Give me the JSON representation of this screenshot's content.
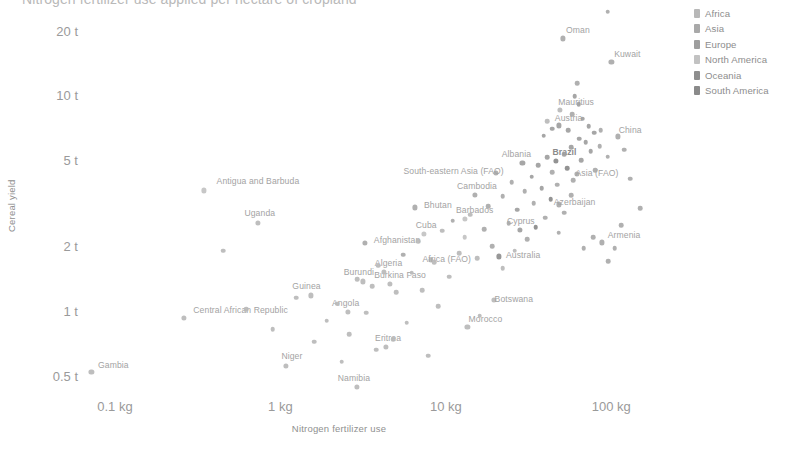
{
  "chart_data": {
    "type": "scatter",
    "title": "Nitrogen fertilizer use applied per hectare of cropland",
    "xlabel": "Nitrogen fertilizer use",
    "ylabel": "Cereal yield",
    "xscale": "log",
    "yscale": "log",
    "xlim": [
      0.055,
      260
    ],
    "ylim": [
      0.42,
      26
    ],
    "grid": false,
    "legend_position": "right",
    "xticks": [
      {
        "value": 0.1,
        "label": "0.1 kg"
      },
      {
        "value": 1,
        "label": "1 kg"
      },
      {
        "value": 10,
        "label": "10 kg"
      },
      {
        "value": 100,
        "label": "100 kg"
      }
    ],
    "yticks": [
      {
        "value": 20,
        "label": "20 t"
      },
      {
        "value": 10,
        "label": "10 t"
      },
      {
        "value": 5,
        "label": "5 t"
      },
      {
        "value": 2,
        "label": "2 t"
      },
      {
        "value": 1,
        "label": "1 t"
      },
      {
        "value": 0.5,
        "label": "0.5 t"
      }
    ],
    "legend": [
      {
        "name": "Africa",
        "color": "#b8b8b8"
      },
      {
        "name": "Asia",
        "color": "#a9a9a9"
      },
      {
        "name": "Europe",
        "color": "#9e9e9e"
      },
      {
        "name": "North America",
        "color": "#c2c2c2"
      },
      {
        "name": "Oceania",
        "color": "#8e8e8e"
      },
      {
        "name": "South America",
        "color": "#8a8a8a"
      }
    ],
    "points": [
      {
        "label": "Gambia",
        "x": 0.072,
        "y": 0.52,
        "continent": "Africa",
        "label_dx": 22,
        "label_dy": -7
      },
      {
        "label": "Central African Republic",
        "x": 0.26,
        "y": 0.93,
        "continent": "Africa",
        "label_dx": 57,
        "label_dy": -8
      },
      {
        "label": "Antigua and Barbuda",
        "x": 0.345,
        "y": 3.62,
        "continent": "North America",
        "label_dx": 54,
        "label_dy": -9
      },
      {
        "label": "Uganda",
        "x": 0.73,
        "y": 2.55,
        "continent": "Africa",
        "label_dx": 2,
        "label_dy": -10
      },
      {
        "label": "Niger",
        "x": 1.08,
        "y": 0.555,
        "continent": "Africa",
        "label_dx": 6,
        "label_dy": -10
      },
      {
        "label": "Guinea",
        "x": 1.52,
        "y": 1.18,
        "continent": "Africa",
        "label_dx": -4,
        "label_dy": -9
      },
      {
        "label": "Angola",
        "x": 2.55,
        "y": 0.99,
        "continent": "Africa",
        "label_dx": -2,
        "label_dy": -9
      },
      {
        "label": "Burundi",
        "x": 3.15,
        "y": 1.37,
        "continent": "Africa",
        "label_dx": -4,
        "label_dy": -9
      },
      {
        "label": "Burkina Faso",
        "x": 4.6,
        "y": 1.33,
        "continent": "Africa",
        "label_dx": 10,
        "label_dy": -9
      },
      {
        "label": "Afghanistan",
        "x": 3.25,
        "y": 2.06,
        "continent": "Asia",
        "label_dx": 32,
        "label_dy": -3
      },
      {
        "label": "Algeria",
        "x": 4.2,
        "y": 1.52,
        "continent": "Africa",
        "label_dx": 5,
        "label_dy": -9
      },
      {
        "label": "Namibia",
        "x": 2.9,
        "y": 0.445,
        "continent": "Africa",
        "label_dx": -3,
        "label_dy": -9
      },
      {
        "label": "Eritrea",
        "x": 4.35,
        "y": 0.68,
        "continent": "Africa",
        "label_dx": 2,
        "label_dy": -9
      },
      {
        "label": "Bhutan",
        "x": 6.5,
        "y": 3.02,
        "continent": "Asia",
        "label_dx": 23,
        "label_dy": -2
      },
      {
        "label": "Cuba",
        "x": 7.4,
        "y": 2.28,
        "continent": "North America",
        "label_dx": 2,
        "label_dy": -9
      },
      {
        "label": "Africa (FAO)",
        "x": 8.1,
        "y": 1.73,
        "continent": "Africa",
        "label_dx": 16,
        "label_dy": -1
      },
      {
        "label": "Morocco",
        "x": 13.5,
        "y": 0.845,
        "continent": "Africa",
        "label_dx": 18,
        "label_dy": -8
      },
      {
        "label": "Botswana",
        "x": 19.5,
        "y": 1.12,
        "continent": "Africa",
        "label_dx": 20,
        "label_dy": -1
      },
      {
        "label": "Barbados",
        "x": 13.0,
        "y": 2.68,
        "continent": "North America",
        "label_dx": 10,
        "label_dy": -9
      },
      {
        "label": "Cambodia",
        "x": 15.0,
        "y": 3.45,
        "continent": "Asia",
        "label_dx": 2,
        "label_dy": -9
      },
      {
        "label": "South-eastern Asia (FAO)",
        "x": 20.0,
        "y": 4.35,
        "continent": "Asia",
        "label_dx": -42,
        "label_dy": -2
      },
      {
        "label": "Albania",
        "x": 29.0,
        "y": 4.85,
        "continent": "Europe",
        "label_dx": -6,
        "label_dy": -9
      },
      {
        "label": "Australia",
        "x": 21.0,
        "y": 1.79,
        "continent": "Oceania",
        "label_dx": 24,
        "label_dy": -1
      },
      {
        "label": "Cyprus",
        "x": 28.0,
        "y": 2.38,
        "continent": "Europe",
        "label_dx": 1,
        "label_dy": -9
      },
      {
        "label": "Brazil",
        "x": 46.0,
        "y": 4.95,
        "continent": "South America",
        "label_dx": 9,
        "label_dy": -9
      },
      {
        "label": "Azerbaijan",
        "x": 48.0,
        "y": 3.12,
        "continent": "Asia",
        "label_dx": 16,
        "label_dy": -2
      },
      {
        "label": "Asia (FAO)",
        "x": 62.0,
        "y": 4.32,
        "continent": "Asia",
        "label_dx": 20,
        "label_dy": -1
      },
      {
        "label": "Mauritius",
        "x": 49.0,
        "y": 8.55,
        "continent": "Africa",
        "label_dx": 16,
        "label_dy": -8
      },
      {
        "label": "Austria",
        "x": 48.0,
        "y": 7.25,
        "continent": "Europe",
        "label_dx": 10,
        "label_dy": -7
      },
      {
        "label": "China",
        "x": 110.0,
        "y": 6.45,
        "continent": "Asia",
        "label_dx": 12,
        "label_dy": -6
      },
      {
        "label": "Armenia",
        "x": 88.0,
        "y": 2.08,
        "continent": "Asia",
        "label_dx": 22,
        "label_dy": -7
      },
      {
        "label": "Oman",
        "x": 51.0,
        "y": 18.4,
        "continent": "Asia",
        "label_dx": 15,
        "label_dy": -8
      },
      {
        "label": "Kuwait",
        "x": 100.0,
        "y": 14.3,
        "continent": "Asia",
        "label_dx": 16,
        "label_dy": -8
      },
      {
        "label": "",
        "x": 95.0,
        "y": 24.5,
        "continent": "Asia"
      },
      {
        "label": "",
        "x": 60.0,
        "y": 9.9,
        "continent": "Europe"
      },
      {
        "label": "",
        "x": 63.5,
        "y": 9.1,
        "continent": "Europe"
      },
      {
        "label": "",
        "x": 58.0,
        "y": 8.2,
        "continent": "Asia"
      },
      {
        "label": "",
        "x": 67.0,
        "y": 7.8,
        "continent": "Europe"
      },
      {
        "label": "",
        "x": 73.0,
        "y": 7.2,
        "continent": "Europe"
      },
      {
        "label": "",
        "x": 55.0,
        "y": 6.9,
        "continent": "Europe"
      },
      {
        "label": "",
        "x": 79.0,
        "y": 6.7,
        "continent": "Europe"
      },
      {
        "label": "",
        "x": 64.0,
        "y": 6.3,
        "continent": "Europe"
      },
      {
        "label": "",
        "x": 70.0,
        "y": 6.05,
        "continent": "Europe"
      },
      {
        "label": "",
        "x": 85.0,
        "y": 5.8,
        "continent": "Asia"
      },
      {
        "label": "",
        "x": 57.0,
        "y": 5.75,
        "continent": "Europe"
      },
      {
        "label": "",
        "x": 75.0,
        "y": 5.5,
        "continent": "Europe"
      },
      {
        "label": "",
        "x": 52.0,
        "y": 5.35,
        "continent": "Europe"
      },
      {
        "label": "",
        "x": 95.0,
        "y": 5.2,
        "continent": "Asia"
      },
      {
        "label": "",
        "x": 41.0,
        "y": 5.15,
        "continent": "Europe"
      },
      {
        "label": "",
        "x": 66.0,
        "y": 5.0,
        "continent": "Europe"
      },
      {
        "label": "",
        "x": 36.0,
        "y": 4.75,
        "continent": "Europe"
      },
      {
        "label": "",
        "x": 54.0,
        "y": 4.6,
        "continent": "South America"
      },
      {
        "label": "",
        "x": 80.0,
        "y": 4.5,
        "continent": "Asia"
      },
      {
        "label": "",
        "x": 44.0,
        "y": 4.4,
        "continent": "Asia"
      },
      {
        "label": "",
        "x": 33.0,
        "y": 4.2,
        "continent": "Europe"
      },
      {
        "label": "",
        "x": 59.0,
        "y": 4.05,
        "continent": "Asia"
      },
      {
        "label": "",
        "x": 25.0,
        "y": 3.95,
        "continent": "Asia"
      },
      {
        "label": "",
        "x": 47.0,
        "y": 3.85,
        "continent": "Asia"
      },
      {
        "label": "",
        "x": 38.0,
        "y": 3.7,
        "continent": "Europe"
      },
      {
        "label": "",
        "x": 30.0,
        "y": 3.6,
        "continent": "Asia"
      },
      {
        "label": "",
        "x": 57.0,
        "y": 3.45,
        "continent": "Asia"
      },
      {
        "label": "",
        "x": 22.0,
        "y": 3.4,
        "continent": "Asia"
      },
      {
        "label": "",
        "x": 43.0,
        "y": 3.3,
        "continent": "South America"
      },
      {
        "label": "",
        "x": 34.0,
        "y": 3.15,
        "continent": "Asia"
      },
      {
        "label": "",
        "x": 18.0,
        "y": 3.05,
        "continent": "Asia"
      },
      {
        "label": "",
        "x": 27.0,
        "y": 2.95,
        "continent": "Europe"
      },
      {
        "label": "",
        "x": 52.0,
        "y": 2.85,
        "continent": "Asia"
      },
      {
        "label": "",
        "x": 14.0,
        "y": 2.8,
        "continent": "Africa"
      },
      {
        "label": "",
        "x": 40.0,
        "y": 2.7,
        "continent": "Asia"
      },
      {
        "label": "",
        "x": 11.0,
        "y": 2.62,
        "continent": "Asia"
      },
      {
        "label": "",
        "x": 24.0,
        "y": 2.55,
        "continent": "Asia"
      },
      {
        "label": "",
        "x": 35.0,
        "y": 2.45,
        "continent": "South America"
      },
      {
        "label": "",
        "x": 17.0,
        "y": 2.4,
        "continent": "Asia"
      },
      {
        "label": "",
        "x": 9.5,
        "y": 2.35,
        "continent": "Africa"
      },
      {
        "label": "",
        "x": 48.0,
        "y": 2.3,
        "continent": "Asia"
      },
      {
        "label": "",
        "x": 13.0,
        "y": 2.2,
        "continent": "North America"
      },
      {
        "label": "",
        "x": 31.0,
        "y": 2.15,
        "continent": "Asia"
      },
      {
        "label": "",
        "x": 6.8,
        "y": 2.1,
        "continent": "Africa"
      },
      {
        "label": "",
        "x": 19.0,
        "y": 2.0,
        "continent": "Asia"
      },
      {
        "label": "",
        "x": 105.0,
        "y": 1.95,
        "continent": "Asia"
      },
      {
        "label": "",
        "x": 26.0,
        "y": 1.9,
        "continent": "Africa"
      },
      {
        "label": "",
        "x": 12.0,
        "y": 1.85,
        "continent": "Africa"
      },
      {
        "label": "",
        "x": 5.5,
        "y": 1.82,
        "continent": "Asia"
      },
      {
        "label": "",
        "x": 15.5,
        "y": 1.75,
        "continent": "Africa"
      },
      {
        "label": "",
        "x": 8.5,
        "y": 1.68,
        "continent": "Africa"
      },
      {
        "label": "",
        "x": 3.9,
        "y": 1.62,
        "continent": "Africa"
      },
      {
        "label": "",
        "x": 22.0,
        "y": 1.58,
        "continent": "Africa"
      },
      {
        "label": "",
        "x": 6.2,
        "y": 1.5,
        "continent": "Africa"
      },
      {
        "label": "",
        "x": 10.5,
        "y": 1.44,
        "continent": "Africa"
      },
      {
        "label": "",
        "x": 2.9,
        "y": 1.4,
        "continent": "Africa"
      },
      {
        "label": "",
        "x": 3.6,
        "y": 1.3,
        "continent": "Africa"
      },
      {
        "label": "",
        "x": 7.2,
        "y": 1.25,
        "continent": "Africa"
      },
      {
        "label": "",
        "x": 5.0,
        "y": 1.22,
        "continent": "Africa"
      },
      {
        "label": "",
        "x": 1.25,
        "y": 1.15,
        "continent": "Africa"
      },
      {
        "label": "",
        "x": 2.2,
        "y": 1.08,
        "continent": "Africa"
      },
      {
        "label": "",
        "x": 9.0,
        "y": 1.05,
        "continent": "Africa"
      },
      {
        "label": "",
        "x": 3.3,
        "y": 0.98,
        "continent": "Africa"
      },
      {
        "label": "",
        "x": 16.0,
        "y": 0.95,
        "continent": "Africa"
      },
      {
        "label": "",
        "x": 1.9,
        "y": 0.9,
        "continent": "Africa"
      },
      {
        "label": "",
        "x": 5.8,
        "y": 0.88,
        "continent": "Africa"
      },
      {
        "label": "",
        "x": 0.9,
        "y": 0.82,
        "continent": "Africa"
      },
      {
        "label": "",
        "x": 2.6,
        "y": 0.78,
        "continent": "Africa"
      },
      {
        "label": "",
        "x": 4.8,
        "y": 0.74,
        "continent": "Africa"
      },
      {
        "label": "",
        "x": 1.6,
        "y": 0.72,
        "continent": "Africa"
      },
      {
        "label": "",
        "x": 3.8,
        "y": 0.66,
        "continent": "Africa"
      },
      {
        "label": "",
        "x": 7.8,
        "y": 0.62,
        "continent": "Africa"
      },
      {
        "label": "",
        "x": 2.35,
        "y": 0.58,
        "continent": "Africa"
      },
      {
        "label": "",
        "x": 0.62,
        "y": 1.02,
        "continent": "Africa"
      },
      {
        "label": "",
        "x": 0.45,
        "y": 1.9,
        "continent": "Africa"
      },
      {
        "label": "",
        "x": 62.0,
        "y": 11.4,
        "continent": "Asia"
      },
      {
        "label": "",
        "x": 41.0,
        "y": 7.6,
        "continent": "Africa"
      },
      {
        "label": "",
        "x": 44.0,
        "y": 7.0,
        "continent": "Europe"
      },
      {
        "label": "",
        "x": 39.0,
        "y": 6.5,
        "continent": "Europe"
      },
      {
        "label": "",
        "x": 86.0,
        "y": 6.9,
        "continent": "Asia"
      },
      {
        "label": "",
        "x": 120.0,
        "y": 5.6,
        "continent": "Asia"
      },
      {
        "label": "",
        "x": 130.0,
        "y": 4.1,
        "continent": "Asia"
      },
      {
        "label": "",
        "x": 150.0,
        "y": 3.0,
        "continent": "Asia"
      },
      {
        "label": "",
        "x": 115.0,
        "y": 2.5,
        "continent": "Asia"
      },
      {
        "label": "",
        "x": 78.0,
        "y": 2.2,
        "continent": "Asia"
      },
      {
        "label": "",
        "x": 68.0,
        "y": 1.95,
        "continent": "Asia"
      },
      {
        "label": "",
        "x": 96.0,
        "y": 1.7,
        "continent": "Asia"
      }
    ]
  }
}
